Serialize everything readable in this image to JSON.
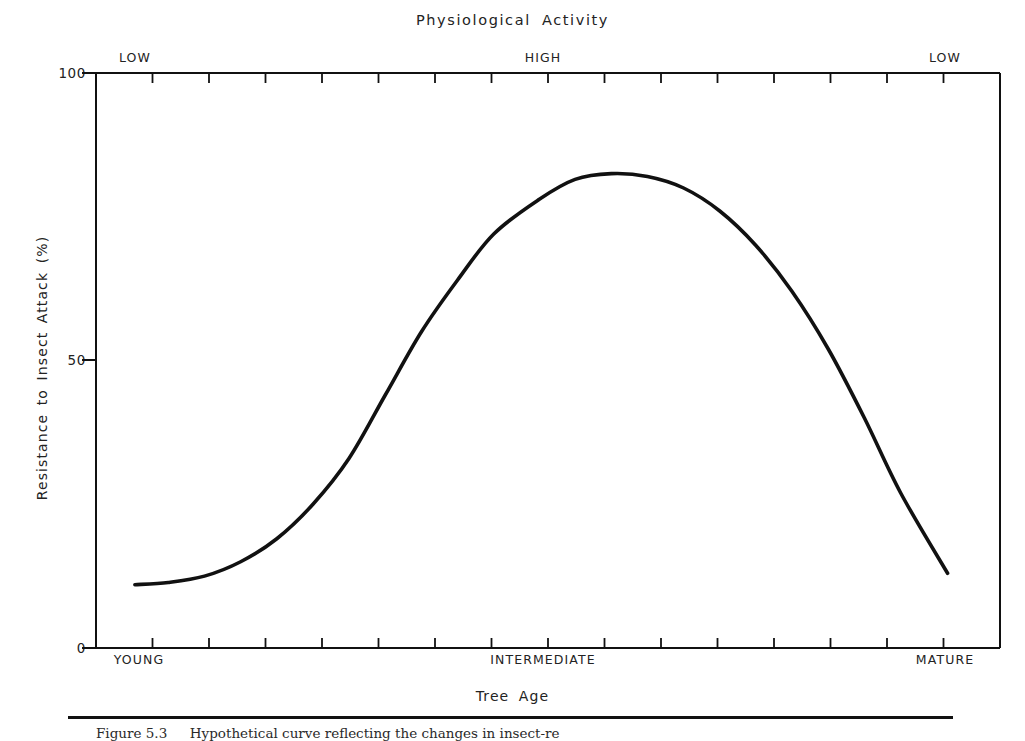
{
  "figure": {
    "title": "Physiological  Activity",
    "caption_label": "Figure 5.3",
    "caption_text": "Hypothetical curve reflecting the changes in insect-re"
  },
  "axes": {
    "y_title": "Resistance to Insect Attack (%)",
    "x_title": "Tree  Age",
    "y_ticks": [
      "100",
      "50",
      "0"
    ],
    "y_tick_values": [
      100,
      50,
      0
    ],
    "top_categories": [
      "LOW",
      "HIGH",
      "LOW"
    ],
    "bottom_categories": [
      "YOUNG",
      "INTERMEDIATE",
      "MATURE"
    ],
    "top_axis_name": "Physiological Activity",
    "bottom_axis_name": "Tree Age",
    "minor_tick_count": 17
  },
  "chart_data": {
    "type": "line",
    "title": "Physiological Activity",
    "xlabel": "Tree Age",
    "ylabel": "Resistance to Insect Attack (%)",
    "ylim": [
      0,
      100
    ],
    "xlim": [
      0,
      100
    ],
    "grid": false,
    "legend": "none",
    "x_tick_labels": [
      "YOUNG",
      "INTERMEDIATE",
      "MATURE"
    ],
    "x_tick_positions": [
      4,
      49,
      94
    ],
    "secondary_x_tick_labels": [
      "LOW",
      "HIGH",
      "LOW"
    ],
    "secondary_x_axis_title": "Physiological Activity",
    "y_tick_labels": [
      "0",
      "50",
      "100"
    ],
    "y_tick_positions": [
      0,
      50,
      100
    ],
    "series": [
      {
        "name": "Resistance to insect attack",
        "x": [
          4.3,
          8,
          12,
          16,
          20,
          24,
          28,
          32,
          36,
          40,
          44,
          49,
          53,
          57,
          61,
          65,
          69,
          73,
          77,
          81,
          85,
          89,
          94.2
        ],
        "values": [
          11,
          11.4,
          12.5,
          15,
          19,
          25,
          33,
          44,
          55,
          64,
          72,
          78,
          81.5,
          82.5,
          82,
          80,
          76,
          70,
          62,
          52,
          40,
          27,
          13
        ]
      }
    ],
    "annotations": [
      {
        "text": "LOW",
        "x": 4.3,
        "axis": "top"
      },
      {
        "text": "HIGH",
        "x": 49.4,
        "axis": "top"
      },
      {
        "text": "LOW",
        "x": 94,
        "axis": "top"
      }
    ]
  },
  "curve_geometry": {
    "plot_left": 96,
    "plot_right": 1000,
    "plot_top": 73,
    "plot_bottom": 648,
    "path": "M 135,583 C 170,580 196,573 218,552 C 243,527 258,493 272,455 C 286,416 290,408 300,389 C 316,357 330,330 348,303 C 370,270 394,240 420,216 C 452,187 487,174 512,172 C 534,170 555,172 576,178 C 604,186 632,203 660,230 C 690,258 718,295 742,335 C 766,374 786,402 804,426 C 822,450 838,480 854,508 C 870,536 888,556 908,567 C 922,574 936,574 948,573"
  },
  "style": {
    "ink": "#111111",
    "background": "#ffffff",
    "curve_width": 3.6,
    "axis_width": 2
  }
}
